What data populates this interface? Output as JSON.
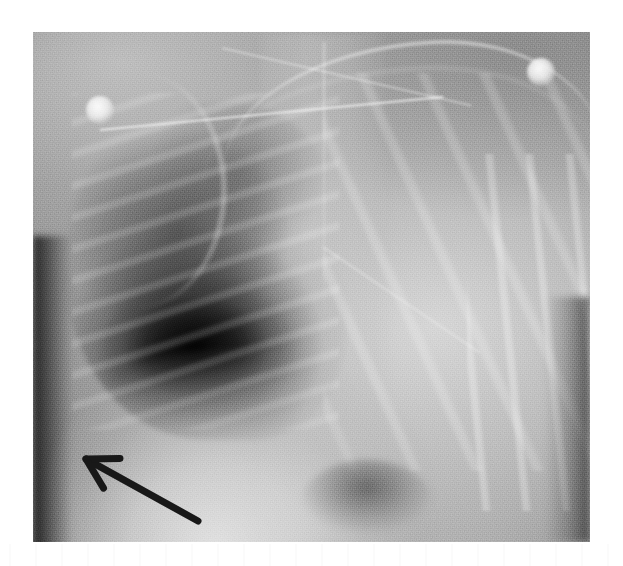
{
  "figure": {
    "modality": "chest-radiograph",
    "view": "AP portable",
    "caption": "",
    "colorspace": "grayscale",
    "canvas": {
      "width": 623,
      "height": 566,
      "background": "#ffffff"
    },
    "plate": {
      "left": 33,
      "top": 32,
      "width": 557,
      "height": 510
    }
  },
  "palette": {
    "page_background": "#ffffff",
    "plate_midtone": "#8f8f8f",
    "lung_lucency_dark": "#141414",
    "soft_tissue_light": "#d6d6d6",
    "opacity_bright": "#e2e2e2",
    "annotation_stroke": "#181818"
  },
  "annotations": [
    {
      "name": "pointer-arrow",
      "type": "arrow",
      "color": "#181818",
      "stroke_width": 7,
      "tip": {
        "x": 86,
        "y": 459
      },
      "tail": {
        "x": 198,
        "y": 521
      },
      "points_to": "blunted costophrenic angle",
      "head_length": 34,
      "head_angle_deg": 30
    }
  ],
  "devices": [
    {
      "name": "ecg-electrode-upper-left",
      "shape": "disc",
      "cx": 100,
      "cy": 110,
      "r": 14,
      "appearance": "bright-radiopaque"
    },
    {
      "name": "ecg-electrode-upper-right",
      "shape": "disc",
      "cx": 541,
      "cy": 72,
      "r": 14,
      "appearance": "bright-radiopaque"
    },
    {
      "name": "monitoring-lead-wire-primary",
      "shape": "line",
      "appearance": "thin-bright-linear"
    },
    {
      "name": "monitoring-lead-wire-secondary",
      "shape": "line",
      "appearance": "thin-bright-linear"
    },
    {
      "name": "monitoring-lead-wire-tertiary",
      "shape": "line",
      "appearance": "thin-bright-linear"
    }
  ],
  "anatomy": [
    {
      "name": "right-lung-field",
      "side": "viewer-left",
      "appearance": "hyperlucent-dark-aerated"
    },
    {
      "name": "right-lung-base-lucency",
      "side": "viewer-left",
      "appearance": "deep-black-basal-pocket"
    },
    {
      "name": "left-hemithorax",
      "side": "viewer-right",
      "appearance": "diffuse-increased-opacity"
    },
    {
      "name": "mediastinum",
      "side": "central",
      "appearance": "uniform-grey-column"
    },
    {
      "name": "thoracic-spine",
      "side": "central",
      "appearance": "faint-vertical-bright-line"
    },
    {
      "name": "elevated-hemidiaphragm",
      "side": "viewer-left",
      "appearance": "bright-curved-meniscus"
    },
    {
      "name": "costophrenic-angle",
      "side": "viewer-left",
      "appearance": "blunted"
    },
    {
      "name": "gastric-bubble",
      "side": "viewer-right-lower",
      "appearance": "dark-subdiaphragmatic-pocket"
    },
    {
      "name": "clavicle",
      "side": "upper",
      "appearance": "bright-arcuate-band"
    },
    {
      "name": "shoulder-humeral-head",
      "side": "viewer-left-upper",
      "appearance": "bright-rounded-margin"
    },
    {
      "name": "ribs-right",
      "side": "viewer-left",
      "appearance": "striated-interspaces"
    },
    {
      "name": "ribs-left",
      "side": "viewer-right",
      "appearance": "faint-oblique-arcs"
    },
    {
      "name": "ribs-lateral-chest-wall",
      "side": "viewer-right-margin",
      "appearance": "stacked-bright-edges"
    }
  ]
}
